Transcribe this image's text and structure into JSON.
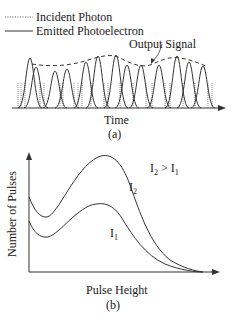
{
  "figure_a": {
    "legend": [
      {
        "label": "Incident Photon",
        "style": "dotted"
      },
      {
        "label": "Emitted Photoelectron",
        "style": "solid"
      }
    ],
    "annotation": "Output Signal",
    "xlabel": "Time",
    "caption": "(a)"
  },
  "figure_b": {
    "ylabel": "Number of Pulses",
    "xlabel": "Pulse Height",
    "curve_labels": {
      "upper": "I",
      "upper_sub": "2",
      "lower": "I",
      "lower_sub": "1"
    },
    "relation": {
      "a": "I",
      "a_sub": "2",
      "op": " > ",
      "b": "I",
      "b_sub": "1"
    },
    "caption": "(b)"
  },
  "colors": {
    "line": "#333333",
    "background": "#ffffff"
  }
}
